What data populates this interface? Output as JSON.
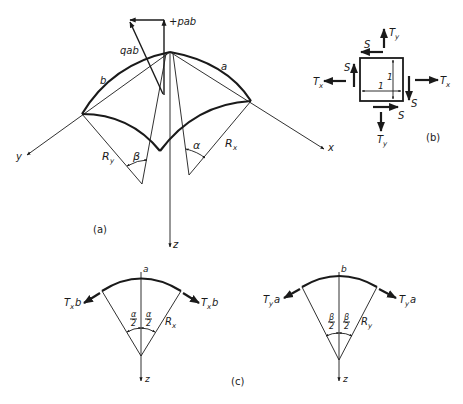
{
  "figure": {
    "panel_labels": {
      "a": "(a)",
      "b": "(b)",
      "c": "(c)"
    },
    "panel_a": {
      "axis_labels": {
        "x": "x",
        "y": "y",
        "z": "z"
      },
      "edge_labels": {
        "a": "a",
        "b": "b"
      },
      "load_labels": {
        "normal": "+pab",
        "resultant": "qab"
      },
      "radius_labels": {
        "x": "R",
        "x_sub": "x",
        "y": "R",
        "y_sub": "y"
      },
      "angle_labels": {
        "alpha": "α",
        "beta": "β"
      }
    },
    "panel_b": {
      "forces": {
        "Tx": {
          "main": "T",
          "sub": "x"
        },
        "Ty": {
          "main": "T",
          "sub": "y"
        },
        "S": "S"
      },
      "side_labels": {
        "horizontal": "1",
        "vertical": "1"
      }
    },
    "panel_c": {
      "left": {
        "top_label": "a",
        "force_label": {
          "main": "T",
          "sub": "x",
          "suffix": "b"
        },
        "half_angle": {
          "numerator": "α",
          "denominator": "2"
        },
        "radius": {
          "main": "R",
          "sub": "x"
        },
        "axis": "z"
      },
      "right": {
        "top_label": "b",
        "force_label": {
          "main": "T",
          "sub": "y",
          "suffix": "a"
        },
        "half_angle": {
          "numerator": "β",
          "denominator": "2"
        },
        "radius": {
          "main": "R",
          "sub": "y"
        },
        "axis": "z"
      }
    }
  }
}
